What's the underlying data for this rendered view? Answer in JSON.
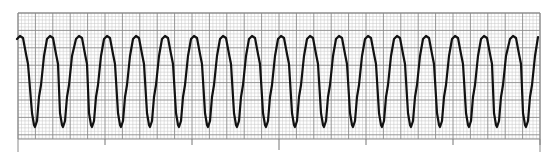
{
  "chart_data": {
    "type": "line",
    "title": "",
    "xlabel": "",
    "ylabel": "",
    "grid": true,
    "legend": null,
    "grid_box": {
      "x0": 18,
      "y0": 13,
      "x1": 540,
      "y1": 139
    },
    "small_square_px": 3.48,
    "major_square_px": 17.4,
    "time_ticks_x": [
      105,
      192,
      279,
      366,
      453,
      540
    ],
    "beat_count": 18,
    "cycle_period_px": 29,
    "peaks_x": [
      20,
      50,
      79,
      107,
      136,
      165,
      194,
      223,
      252,
      281,
      310,
      339,
      368,
      397,
      426,
      455,
      484,
      513
    ],
    "troughs_x": [
      35,
      63,
      92,
      121,
      150,
      179,
      208,
      237,
      266,
      295,
      324,
      353,
      382,
      411,
      440,
      469,
      497,
      526
    ],
    "peak_y": 36,
    "trough_y": 127,
    "trace_end": {
      "x": 538,
      "y": 37
    }
  },
  "colors": {
    "background": "#ffffff",
    "grid_minor": "#c4c4c4",
    "grid_major": "#8a8a8a",
    "trace": "#111111"
  }
}
